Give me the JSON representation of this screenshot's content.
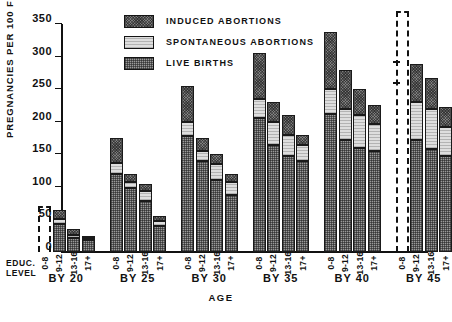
{
  "chart_data": {
    "type": "bar",
    "subtype": "grouped-stacked",
    "title": "",
    "xlabel": "AGE",
    "ylabel": "PREGNANCIES PER 100 FEMALES",
    "ylim": [
      0,
      350
    ],
    "ytick_values": [
      0,
      50,
      100,
      150,
      200,
      250,
      300,
      350
    ],
    "ytick_labels": [
      "0",
      "50",
      "100",
      "150",
      "200",
      "250",
      "300",
      "350"
    ],
    "grid": false,
    "legend_position": "top-center",
    "legend": [
      {
        "name": "INDUCED ABORTIONS",
        "pattern": "dark-crosshatch"
      },
      {
        "name": "SPONTANEOUS ABORTIONS",
        "pattern": "light-stipple"
      },
      {
        "name": "LIVE BIRTHS",
        "pattern": "medium-grid"
      }
    ],
    "series": [
      {
        "name": "LIVE BIRTHS",
        "key": "live_births"
      },
      {
        "name": "SPONTANEOUS ABORTIONS",
        "key": "spontaneous_abortions"
      },
      {
        "name": "INDUCED ABORTIONS",
        "key": "induced_abortions"
      }
    ],
    "education_levels": [
      "0-8",
      "9-12",
      "13-16",
      "17+"
    ],
    "groups": [
      {
        "label": "BY 20",
        "bars": [
          {
            "edu": "0-8",
            "dashed": true,
            "total": 70,
            "live_births": 0,
            "spontaneous_abortions": 0,
            "induced_abortions": 0,
            "marks": []
          },
          {
            "edu": "9-12",
            "dashed": false,
            "total": 65,
            "live_births": 43,
            "spontaneous_abortions": 8,
            "induced_abortions": 14
          },
          {
            "edu": "13-16",
            "dashed": false,
            "total": 35,
            "live_births": 21,
            "spontaneous_abortions": 5,
            "induced_abortions": 9
          },
          {
            "edu": "17+",
            "dashed": false,
            "total": 25,
            "live_births": 18,
            "spontaneous_abortions": 3,
            "induced_abortions": 4
          }
        ]
      },
      {
        "label": "BY 25",
        "bars": [
          {
            "edu": "0-8",
            "dashed": false,
            "total": 175,
            "live_births": 120,
            "spontaneous_abortions": 17,
            "induced_abortions": 38
          },
          {
            "edu": "9-12",
            "dashed": false,
            "total": 120,
            "live_births": 98,
            "spontaneous_abortions": 10,
            "induced_abortions": 12
          },
          {
            "edu": "13-16",
            "dashed": false,
            "total": 105,
            "live_births": 78,
            "spontaneous_abortions": 15,
            "induced_abortions": 12
          },
          {
            "edu": "17+",
            "dashed": false,
            "total": 55,
            "live_births": 40,
            "spontaneous_abortions": 8,
            "induced_abortions": 7
          }
        ]
      },
      {
        "label": "BY 30",
        "bars": [
          {
            "edu": "0-8",
            "dashed": false,
            "total": 255,
            "live_births": 178,
            "spontaneous_abortions": 22,
            "induced_abortions": 55
          },
          {
            "edu": "9-12",
            "dashed": false,
            "total": 175,
            "live_births": 140,
            "spontaneous_abortions": 15,
            "induced_abortions": 20
          },
          {
            "edu": "13-16",
            "dashed": false,
            "total": 150,
            "live_births": 110,
            "spontaneous_abortions": 25,
            "induced_abortions": 15
          },
          {
            "edu": "17+",
            "dashed": false,
            "total": 120,
            "live_births": 88,
            "spontaneous_abortions": 20,
            "induced_abortions": 12
          }
        ]
      },
      {
        "label": "BY 35",
        "bars": [
          {
            "edu": "0-8",
            "dashed": false,
            "total": 305,
            "live_births": 205,
            "spontaneous_abortions": 30,
            "induced_abortions": 70
          },
          {
            "edu": "9-12",
            "dashed": false,
            "total": 230,
            "live_births": 165,
            "spontaneous_abortions": 35,
            "induced_abortions": 30
          },
          {
            "edu": "13-16",
            "dashed": false,
            "total": 210,
            "live_births": 148,
            "spontaneous_abortions": 32,
            "induced_abortions": 30
          },
          {
            "edu": "17+",
            "dashed": false,
            "total": 180,
            "live_births": 140,
            "spontaneous_abortions": 25,
            "induced_abortions": 15
          }
        ]
      },
      {
        "label": "BY 40",
        "bars": [
          {
            "edu": "0-8",
            "dashed": false,
            "total": 338,
            "live_births": 212,
            "spontaneous_abortions": 38,
            "induced_abortions": 88
          },
          {
            "edu": "9-12",
            "dashed": false,
            "total": 280,
            "live_births": 172,
            "spontaneous_abortions": 48,
            "induced_abortions": 60
          },
          {
            "edu": "13-16",
            "dashed": false,
            "total": 250,
            "live_births": 160,
            "spontaneous_abortions": 50,
            "induced_abortions": 40
          },
          {
            "edu": "17+",
            "dashed": false,
            "total": 225,
            "live_births": 155,
            "spontaneous_abortions": 42,
            "induced_abortions": 28
          }
        ]
      },
      {
        "label": "BY 45",
        "bars": [
          {
            "edu": "0-8",
            "dashed": true,
            "total": 370,
            "live_births": 0,
            "spontaneous_abortions": 0,
            "induced_abortions": 0,
            "marks": [
              258,
              290
            ]
          },
          {
            "edu": "9-12",
            "dashed": false,
            "total": 288,
            "live_births": 172,
            "spontaneous_abortions": 58,
            "induced_abortions": 58
          },
          {
            "edu": "13-16",
            "dashed": false,
            "total": 267,
            "live_births": 158,
            "spontaneous_abortions": 62,
            "induced_abortions": 47
          },
          {
            "edu": "17+",
            "dashed": false,
            "total": 222,
            "live_births": 148,
            "spontaneous_abortions": 44,
            "induced_abortions": 30
          }
        ]
      }
    ]
  },
  "axis": {
    "y_title": "PREGNANCIES PER 100 FEMALES",
    "x_title": "AGE",
    "edu_caption_line1": "EDUC.",
    "edu_caption_line2": "LEVEL"
  }
}
